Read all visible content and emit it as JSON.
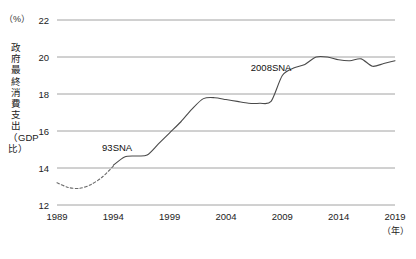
{
  "chart_data": {
    "type": "line",
    "title": "",
    "xlabel": "年",
    "ylabel": "政府最終消費支出（GDP比）",
    "yunit": "（%）",
    "xlim": [
      1989,
      2019
    ],
    "ylim": [
      12,
      22
    ],
    "grid": true,
    "legend": "none",
    "ytick_labels": [
      "22",
      "20",
      "18",
      "16",
      "14",
      "12"
    ],
    "ytick_values": [
      22,
      20,
      18,
      16,
      14,
      12
    ],
    "xtick_labels": [
      "1989",
      "1994",
      "1999",
      "2004",
      "2009",
      "2014",
      "2019"
    ],
    "xtick_values": [
      1989,
      1994,
      1999,
      2004,
      2009,
      2014,
      2019
    ],
    "annotations": [
      {
        "text": "93SNA",
        "x": 1993.0,
        "y": 15.1
      },
      {
        "text": "2008SNA",
        "x": 2006.2,
        "y": 19.4
      }
    ],
    "series": [
      {
        "name": "93SNA",
        "style": "dashed",
        "x": [
          1989,
          1990,
          1991,
          1992,
          1993,
          1994
        ],
        "values": [
          13.2,
          12.95,
          12.9,
          13.1,
          13.5,
          14.1
        ]
      },
      {
        "name": "2008SNA",
        "style": "solid",
        "x": [
          1994,
          1995,
          1996,
          1997,
          1998,
          1999,
          2000,
          2001,
          2002,
          2003,
          2004,
          2005,
          2006,
          2007,
          2008,
          2009,
          2010,
          2011,
          2012,
          2013,
          2014,
          2015,
          2016,
          2017,
          2018,
          2019
        ],
        "values": [
          14.15,
          14.6,
          14.65,
          14.7,
          15.3,
          15.9,
          16.5,
          17.2,
          17.75,
          17.8,
          17.7,
          17.6,
          17.5,
          17.5,
          17.6,
          19.0,
          19.4,
          19.6,
          20.0,
          20.0,
          19.85,
          19.8,
          19.9,
          19.5,
          19.65,
          19.8
        ]
      }
    ]
  }
}
